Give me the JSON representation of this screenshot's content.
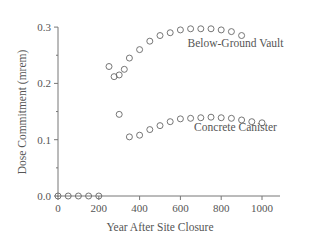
{
  "chart_data": {
    "type": "scatter",
    "title": "",
    "xlabel": "Year After Site Closure",
    "ylabel": "Dose Commitment (mrem)",
    "xlim": [
      0,
      1050
    ],
    "ylim": [
      0,
      0.3
    ],
    "x_ticks": [
      0,
      200,
      400,
      600,
      800,
      1000
    ],
    "x_tick_labels": [
      "0",
      "200",
      "400",
      "600",
      "800",
      "1000"
    ],
    "y_ticks": [
      0.0,
      0.1,
      0.2,
      0.3
    ],
    "y_tick_labels": [
      "0.0",
      "0.1",
      "0.2",
      "0.3"
    ],
    "y_minor_ticks": [
      0.05,
      0.15,
      0.25
    ],
    "grid": false,
    "legend": "inline labels",
    "marker": "open circle",
    "series": [
      {
        "name": "Baseline",
        "label": "",
        "x": [
          0,
          50,
          100,
          150,
          200
        ],
        "values": [
          0,
          0,
          0,
          0,
          0
        ]
      },
      {
        "name": "Below-Ground Vault",
        "label": "Below-Ground Vault",
        "x": [
          250,
          275,
          300,
          325,
          350,
          400,
          450,
          500,
          550,
          600,
          650,
          700,
          750,
          800,
          850,
          900
        ],
        "values": [
          0.23,
          0.212,
          0.215,
          0.225,
          0.245,
          0.26,
          0.275,
          0.285,
          0.29,
          0.295,
          0.297,
          0.297,
          0.297,
          0.295,
          0.292,
          0.285
        ]
      },
      {
        "name": "Concrete Canister",
        "label": "Concrete Canister",
        "x": [
          300,
          350,
          400,
          450,
          500,
          550,
          600,
          650,
          700,
          750,
          800,
          850,
          900,
          950,
          1000
        ],
        "values": [
          0.145,
          0.105,
          0.108,
          0.118,
          0.125,
          0.132,
          0.137,
          0.138,
          0.139,
          0.14,
          0.139,
          0.138,
          0.135,
          0.132,
          0.13
        ]
      }
    ],
    "annotations": [
      {
        "text": "Below-Ground Vault",
        "x": 870,
        "y": 0.265
      },
      {
        "text": "Concrete Canister",
        "x": 870,
        "y": 0.115
      }
    ]
  }
}
